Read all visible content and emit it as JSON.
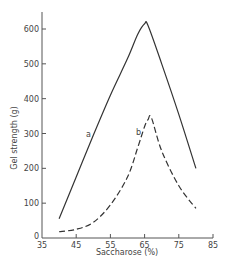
{
  "chart_data": {
    "type": "line",
    "title": "",
    "xlabel": "Saccharose (%)",
    "ylabel": "Gel strength (g)",
    "xlim": [
      35,
      85
    ],
    "ylim": [
      0,
      650
    ],
    "x_ticks": [
      35,
      45,
      55,
      65,
      75,
      85
    ],
    "y_ticks": [
      0,
      100,
      200,
      300,
      400,
      500,
      600
    ],
    "grid": false,
    "legend": "none (curves labelled inline 'a' and 'b')",
    "series": [
      {
        "name": "a",
        "style": "solid",
        "x": [
          40,
          45,
          50,
          55,
          60,
          63,
          65,
          66,
          70,
          75,
          80
        ],
        "y": [
          55,
          175,
          295,
          410,
          515,
          585,
          615,
          610,
          500,
          355,
          200
        ]
      },
      {
        "name": "b",
        "style": "dashed",
        "x": [
          40,
          45,
          50,
          55,
          60,
          63,
          65,
          66,
          67,
          70,
          75,
          80
        ],
        "y": [
          18,
          25,
          45,
          95,
          175,
          260,
          320,
          340,
          345,
          250,
          150,
          85
        ]
      }
    ]
  },
  "labels": {
    "xlabel": "Saccharose (%)",
    "ylabel": "Gel strength (g)",
    "curve_a": "a",
    "curve_b": "b",
    "x_ticks": [
      "35",
      "45",
      "55",
      "65",
      "75",
      "85"
    ],
    "y_ticks": [
      "0",
      "100",
      "200",
      "300",
      "400",
      "500",
      "600"
    ]
  }
}
